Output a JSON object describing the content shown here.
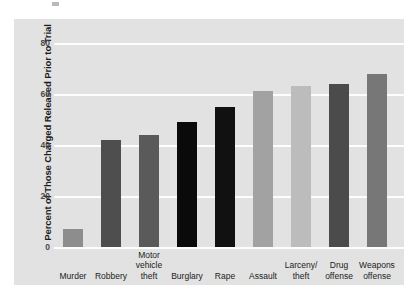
{
  "chart_data": {
    "type": "bar",
    "title": "",
    "xlabel": "",
    "ylabel": "Percent of Those Charged Released Prior to Trial",
    "ylim": [
      0,
      87
    ],
    "yticks": [
      0,
      20,
      40,
      60,
      80
    ],
    "ytick_labels": [
      "0",
      "20",
      "40",
      "60",
      "80"
    ],
    "grid": true,
    "legend": "none",
    "categories": [
      "Murder",
      "Robbery",
      "Motor vehicle theft",
      "Burglary",
      "Rape",
      "Assault",
      "Larceny/ theft",
      "Drug offense",
      "Weapons offense"
    ],
    "category_lines": [
      [
        "Murder"
      ],
      [
        "Robbery"
      ],
      [
        "Motor",
        "vehicle",
        "theft"
      ],
      [
        "Burglary"
      ],
      [
        "Rape"
      ],
      [
        "Assault"
      ],
      [
        "Larceny/",
        "theft"
      ],
      [
        "Drug",
        "offense"
      ],
      [
        "Weapons",
        "offense"
      ]
    ],
    "values": [
      7,
      42,
      44,
      49,
      55,
      61,
      63,
      64,
      68
    ],
    "bar_colors": [
      "#8d8d8d",
      "#4e4e4e",
      "#5a5a5a",
      "#0a0a0a",
      "#111111",
      "#a2a2a2",
      "#bcbcbc",
      "#4b4b4b",
      "#777777"
    ],
    "plot_background": "#e2e2e2",
    "gridline_color": "#fdfdfd",
    "figure_background": "#ffffff"
  }
}
